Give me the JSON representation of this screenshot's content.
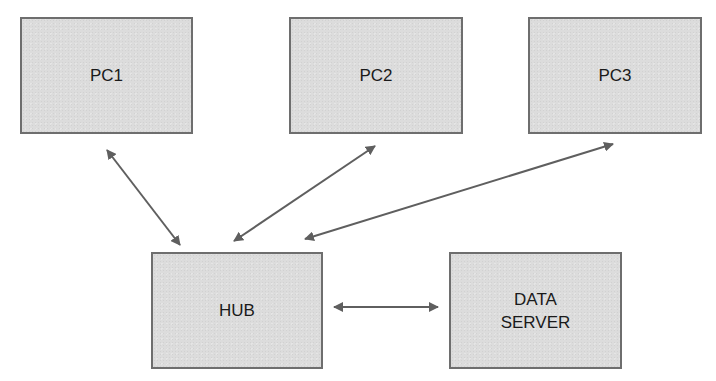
{
  "diagram": {
    "colors": {
      "node_fill": "#dcdcdc",
      "node_border": "#6e6e6e",
      "arrow": "#5f5f5f",
      "text": "#1a1a1a",
      "background": "#ffffff"
    },
    "nodes": [
      {
        "id": "pc1",
        "label": "PC1",
        "x": 20,
        "y": 17,
        "w": 173,
        "h": 117
      },
      {
        "id": "pc2",
        "label": "PC2",
        "x": 289,
        "y": 17,
        "w": 174,
        "h": 117
      },
      {
        "id": "pc3",
        "label": "PC3",
        "x": 528,
        "y": 17,
        "w": 174,
        "h": 117
      },
      {
        "id": "hub",
        "label": "HUB",
        "x": 151,
        "y": 252,
        "w": 172,
        "h": 117
      },
      {
        "id": "data_server",
        "label": "DATA\nSERVER",
        "x": 449,
        "y": 252,
        "w": 173,
        "h": 117
      }
    ],
    "edges": [
      {
        "from": "pc1",
        "to": "hub",
        "bidirectional": true,
        "x1": 107,
        "y1": 150,
        "x2": 180,
        "y2": 245
      },
      {
        "from": "pc2",
        "to": "hub",
        "bidirectional": true,
        "x1": 375,
        "y1": 146,
        "x2": 234,
        "y2": 241
      },
      {
        "from": "pc3",
        "to": "hub",
        "bidirectional": true,
        "x1": 613,
        "y1": 144,
        "x2": 305,
        "y2": 239
      },
      {
        "from": "hub",
        "to": "data_server",
        "bidirectional": true,
        "x1": 334,
        "y1": 307,
        "x2": 438,
        "y2": 307
      }
    ]
  }
}
